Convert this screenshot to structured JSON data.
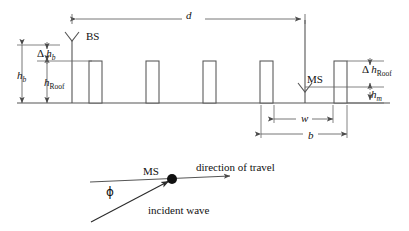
{
  "figure": {
    "stroke_color": "#555555",
    "text_color": "#111111",
    "background": "#ffffff"
  },
  "labels": {
    "h_b": {
      "symbol": "h",
      "subscript": "b",
      "subscript_style": "italic",
      "text": "hb"
    },
    "delta_h_b": {
      "prefix": "Δ",
      "symbol": "h",
      "subscript": "b",
      "subscript_style": "italic",
      "text": "Δ hb"
    },
    "h_roof": {
      "symbol": "h",
      "subscript": "Roof",
      "subscript_style": "upright",
      "text": "hRoof"
    },
    "delta_h_roof": {
      "prefix": "Δ",
      "symbol": "h",
      "subscript": "Roof",
      "subscript_style": "upright",
      "text": "Δ hRoof"
    },
    "h_m": {
      "symbol": "h",
      "subscript": "m",
      "subscript_style": "italic",
      "text": "hm"
    },
    "d": {
      "symbol": "d",
      "text": "d"
    },
    "w": {
      "symbol": "w",
      "text": "w"
    },
    "b": {
      "symbol": "b",
      "text": "b"
    },
    "bs": {
      "text": "BS"
    },
    "ms_top": {
      "text": "MS"
    },
    "ms_bottom": {
      "text": "MS"
    },
    "phi": {
      "text": "ϕ"
    },
    "direction_of_travel": {
      "text": "direction of travel"
    },
    "incident_wave": {
      "text": "incident wave"
    }
  },
  "geometry": {
    "ground_line": {
      "x1": 17,
      "x2": 390,
      "y": 103
    },
    "buildings": [
      {
        "x": 89,
        "width": 13,
        "top": 61,
        "bottom": 103
      },
      {
        "x": 146,
        "width": 13,
        "top": 61,
        "bottom": 103
      },
      {
        "x": 203,
        "width": 13,
        "top": 61,
        "bottom": 103
      },
      {
        "x": 260,
        "width": 13,
        "top": 61,
        "bottom": 103
      },
      {
        "x": 334,
        "width": 13,
        "top": 61,
        "bottom": 103
      }
    ],
    "bs_mast": {
      "x": 72,
      "top": 40,
      "bottom": 103,
      "antenna_half_width": 7,
      "antenna_depth": 9
    },
    "ms_mast": {
      "x": 305,
      "top": 20,
      "bottom": 103,
      "antenna_half_width": 7,
      "antenna_depth": 9,
      "antenna_apex_y": 92
    },
    "dimensions": {
      "d": {
        "y": 19,
        "x1": 72,
        "x2": 305
      },
      "h_b": {
        "x": 22,
        "y1": 45,
        "y2": 103
      },
      "delta_h_b": {
        "x": 47,
        "y1": 45,
        "y2": 61
      },
      "h_roof": {
        "x": 47,
        "y1": 61,
        "y2": 103
      },
      "delta_h_roof": {
        "x": 370,
        "y1": 61,
        "y2": 87
      },
      "h_m": {
        "x": 370,
        "y1": 87,
        "y2": 103
      },
      "w": {
        "y": 119,
        "x1": 274,
        "x2": 333
      },
      "b": {
        "y": 134,
        "x1": 261,
        "x2": 347
      }
    }
  },
  "lower_diagram": {
    "travel_line": {
      "x1": 90,
      "y1": 182,
      "x2": 230,
      "y2": 176
    },
    "incident_ray": {
      "x1": 91,
      "y1": 222,
      "x2": 169,
      "y2": 180
    },
    "ms_dot": {
      "cx": 172,
      "cy": 179,
      "r": 5
    }
  }
}
